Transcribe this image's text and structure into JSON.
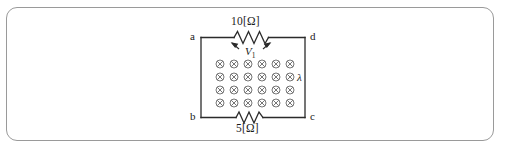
{
  "figure": {
    "type": "physics-circuit-diagram",
    "background_color": "#ffffff",
    "frame": {
      "border_color": "#9a9a9a",
      "corner_radius_px": 11
    },
    "wire_color": "#2b2b2b",
    "symbol_color": "#555555",
    "text_color": "#1a1a1a"
  },
  "circuit": {
    "node_labels": {
      "top_left": "a",
      "top_right": "d",
      "bottom_left": "b",
      "bottom_right": "c"
    },
    "resistors": [
      {
        "id": "top-resistor",
        "label": "10[Ω]",
        "position": "top",
        "value": 10,
        "unit": "Ω"
      },
      {
        "id": "bottom-resistor",
        "label": "5[Ω]",
        "position": "bottom",
        "value": 5,
        "unit": "Ω"
      }
    ],
    "voltage_label": {
      "text": "V",
      "subscript": "1",
      "arrows": "inward-both-sides"
    },
    "field_region": {
      "symbol": "⊗",
      "meaning": "magnetic-field-into-page",
      "columns": 6,
      "rows": 4,
      "annotation": "λ"
    }
  }
}
